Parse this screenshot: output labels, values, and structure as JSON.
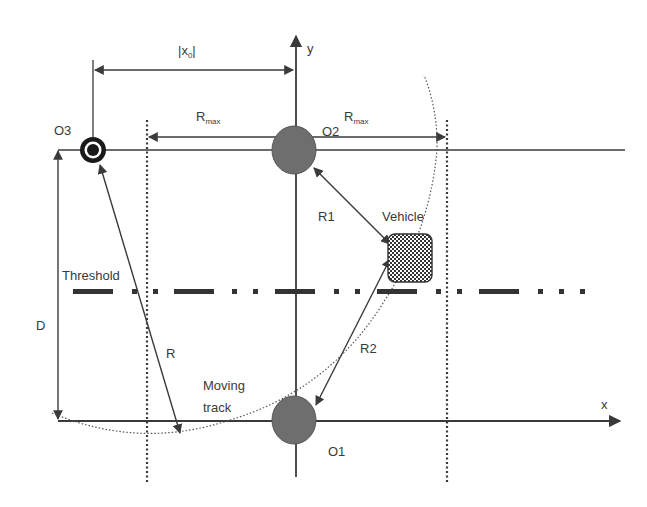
{
  "diagram": {
    "labels": {
      "x0": "|x",
      "x0_sub": "0",
      "x0_close": "|",
      "y_axis": "y",
      "x_axis": "x",
      "rmax_left": "R",
      "rmax_left_sub": "max",
      "rmax_right": "R",
      "rmax_right_sub": "max",
      "o3": "O3",
      "o2": "O2",
      "o1": "O1",
      "r1": "R1",
      "r2": "R2",
      "r": "R",
      "d": "D",
      "vehicle": "Vehicle",
      "threshold": "Threshold",
      "moving_track_1": "Moving",
      "moving_track_2": "track"
    },
    "colors": {
      "line": "#3a3a3a",
      "node_fill": "#6e6e6e",
      "node_stroke": "#555555",
      "background": "#ffffff"
    }
  }
}
